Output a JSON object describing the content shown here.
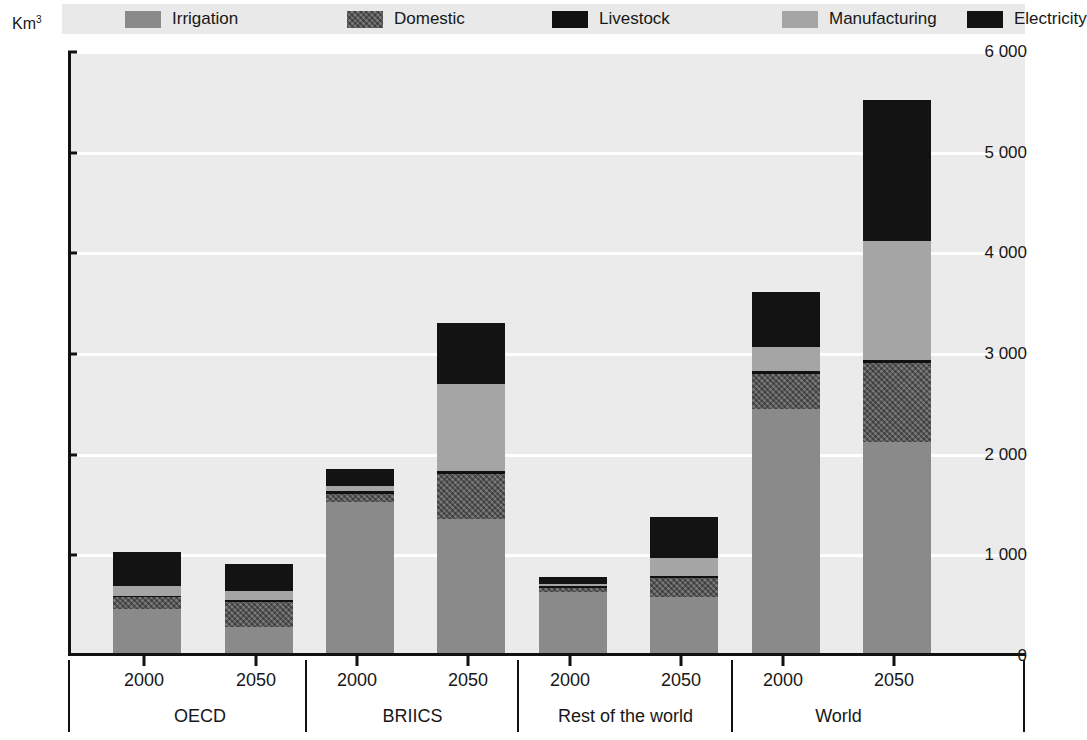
{
  "chart_data": {
    "type": "bar",
    "stacked": true,
    "title": "",
    "xlabel": "",
    "ylabel": "Km³",
    "ylim": [
      0,
      6000
    ],
    "ytick_labels": [
      "0",
      "1 000",
      "2 000",
      "3 000",
      "4 000",
      "5 000",
      "6 000"
    ],
    "ytick_values": [
      0,
      1000,
      2000,
      3000,
      4000,
      5000,
      6000
    ],
    "grid": true,
    "legend_position": "top",
    "groups": [
      "OECD",
      "BRIICS",
      "Rest of the world",
      "World"
    ],
    "years": [
      "2000",
      "2050"
    ],
    "categories": [
      "OECD 2000",
      "OECD 2050",
      "BRIICS 2000",
      "BRIICS 2050",
      "Rest of the world 2000",
      "Rest of the world 2050",
      "World 2000",
      "World 2050"
    ],
    "series": [
      {
        "name": "Irrigation",
        "color": "#8a8a8a",
        "values": [
          435,
          260,
          1500,
          1330,
          605,
          555,
          2420,
          2100
        ]
      },
      {
        "name": "Domestic",
        "color": "#5e5e5e",
        "values": [
          120,
          250,
          80,
          450,
          40,
          195,
          350,
          780
        ]
      },
      {
        "name": "Livestock",
        "color": "#111111",
        "values": [
          15,
          15,
          25,
          25,
          20,
          20,
          30,
          30
        ]
      },
      {
        "name": "Manufacturing",
        "color": "#a5a5a5",
        "values": [
          100,
          95,
          55,
          865,
          20,
          175,
          240,
          1180
        ]
      },
      {
        "name": "Electricity",
        "color": "#131313",
        "values": [
          330,
          265,
          170,
          610,
          70,
          410,
          550,
          1400
        ]
      }
    ],
    "totals": [
      1000,
      885,
      1830,
      3280,
      755,
      1355,
      3590,
      5490
    ]
  },
  "legend": {
    "items": [
      {
        "label": "Irrigation",
        "swatch": "fill-irrigation"
      },
      {
        "label": "Domestic",
        "swatch": "fill-domestic"
      },
      {
        "label": "Livestock",
        "swatch": "fill-livestock"
      },
      {
        "label": "Manufacturing",
        "swatch": "fill-manufacturing"
      },
      {
        "label": "Electricity",
        "swatch": "fill-electricity"
      }
    ]
  },
  "axis": {
    "unit_base": "Km",
    "unit_exponent": "3"
  },
  "colors": {
    "plot_background": "#ebebeb",
    "legend_background": "#e9e9e9",
    "gridline": "#ffffff",
    "axis": "#111111"
  }
}
